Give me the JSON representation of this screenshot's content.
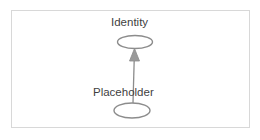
{
  "diagram": {
    "type": "uml-generalization",
    "background_color": "#ffffff",
    "frame": {
      "border_color": "#d8d8d8",
      "fill_color": "#ffffff"
    },
    "stroke_color": "#8c8c8c",
    "label_color": "#3f3f3f",
    "nodes": [
      {
        "id": "identity",
        "label": "Identity",
        "shape": "ellipse",
        "cx": 135,
        "cy": 42,
        "rx": 17.5,
        "ry": 6.5,
        "label_x": 111,
        "label_y": 16
      },
      {
        "id": "placeholder",
        "label": "Placeholder",
        "shape": "ellipse",
        "cx": 132,
        "cy": 110.5,
        "rx": 18,
        "ry": 7.5,
        "label_x": 93,
        "label_y": 86
      }
    ],
    "edges": [
      {
        "id": "placeholder-to-identity",
        "from": "placeholder",
        "to": "identity",
        "arrowhead": "solid-triangle",
        "x1": 133,
        "y1": 103,
        "x2": 134,
        "y2": 49
      }
    ]
  }
}
